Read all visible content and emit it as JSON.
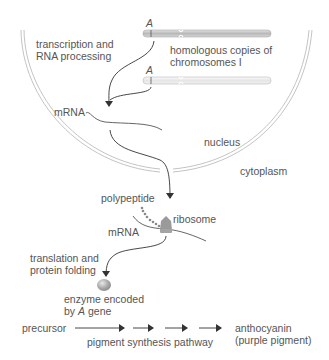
{
  "labels": {
    "transcription_line1": "transcription and",
    "transcription_line2": "RNA processing",
    "allele_top": "A",
    "allele_bottom": "A",
    "homologous_line1": "homologous copies of",
    "homologous_line2": "chromosomes I",
    "mrna_nucleus": "mRNA",
    "nucleus": "nucleus",
    "cytoplasm": "cytoplasm",
    "polypeptide": "polypeptide",
    "ribosome": "ribosome",
    "mrna_cytoplasm": "mRNA",
    "translation_line1": "translation and",
    "translation_line2": "protein folding",
    "enzyme_line1": "enzyme encoded",
    "enzyme_line2_prefix": "by ",
    "enzyme_line2_gene": "A",
    "enzyme_line2_suffix": " gene",
    "precursor": "precursor",
    "pathway": "pigment synthesis pathway",
    "product_line1": "anthocyanin",
    "product_line2": "(purple pigment)"
  },
  "colors": {
    "membrane": "#c8c8c8",
    "chromosome_dark": "#bdbdbd",
    "chromosome_light": "#ededed",
    "arrow": "#333333",
    "ribosome": "#9a9a9a",
    "enzyme": "#a8a8a8",
    "text": "#555555"
  }
}
